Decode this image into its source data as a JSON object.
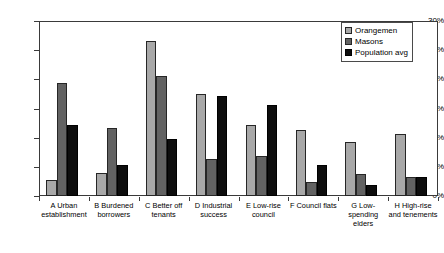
{
  "chart_data": {
    "type": "bar",
    "title": "",
    "subtitle": "",
    "xlabel": "",
    "ylabel": "",
    "ylim": [
      0,
      30
    ],
    "y_unit": "%",
    "y_ticks": [
      "0%",
      "5%",
      "10%",
      "15%",
      "20%",
      "25%",
      "30%"
    ],
    "y_tick_values": [
      0,
      5,
      10,
      15,
      20,
      25,
      30
    ],
    "grid": true,
    "legend_position": "top-right",
    "categories": [
      "A Urban establishment",
      "B Burdened borrowers",
      "C Better off tenants",
      "D Industrial success",
      "E Low-rise council",
      "F Council flats",
      "G Low-spending elders",
      "H High-rise and tenements"
    ],
    "series": [
      {
        "name": "Orangemen",
        "color": "#a8a8a8",
        "values": [
          2.7,
          4.0,
          26.6,
          17.5,
          12.2,
          11.4,
          9.3,
          10.6
        ]
      },
      {
        "name": "Masons",
        "color": "#626262",
        "values": [
          19.4,
          11.7,
          20.6,
          6.3,
          6.8,
          2.4,
          3.7,
          3.2
        ]
      },
      {
        "name": "Population avg",
        "color": "#0d0d0d",
        "values": [
          12.2,
          5.4,
          9.8,
          17.1,
          15.6,
          5.3,
          1.9,
          3.3
        ]
      }
    ]
  }
}
